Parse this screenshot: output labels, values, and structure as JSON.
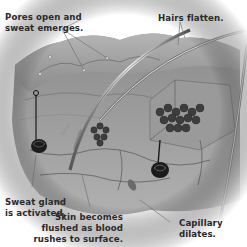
{
  "diagram": {
    "colors": {
      "background": "#ffffff",
      "skin_surface": "#9a9a9a",
      "skin_light": "#c8c8c8",
      "tissue_dark": "#4a4a4a",
      "gland": "#1a1a1a",
      "leader_line": "#6a6a6a",
      "label_text": "#2a2a2a"
    },
    "labels": [
      {
        "id": "pores",
        "lines": [
          "Pores open and",
          "sweat emerges."
        ]
      },
      {
        "id": "hairs",
        "lines": [
          "Hairs flatten."
        ]
      },
      {
        "id": "sweat_gland",
        "lines": [
          "Sweat gland",
          "is activated."
        ]
      },
      {
        "id": "skin_flush",
        "lines": [
          "Skin becomes",
          "flushed as blood",
          "rushes to surface."
        ]
      },
      {
        "id": "capillary",
        "lines": [
          "Capillary",
          "dilates."
        ]
      }
    ]
  }
}
